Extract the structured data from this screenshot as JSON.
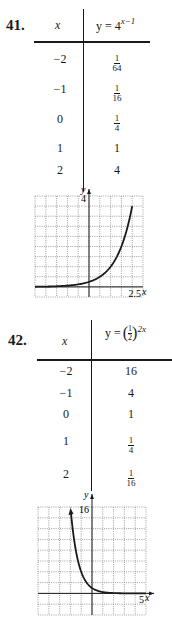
{
  "problems": [
    {
      "number": "41.",
      "x_header": "x",
      "y_header": {
        "lhs": "y = 4",
        "exponent": "x−1"
      },
      "rows": [
        {
          "x": "−2",
          "y_num": "1",
          "y_den": "64",
          "y_text": ""
        },
        {
          "x": "−1",
          "y_num": "1",
          "y_den": "16",
          "y_text": ""
        },
        {
          "x": "0",
          "y_num": "1",
          "y_den": "4",
          "y_text": ""
        },
        {
          "x": "1",
          "y_num": "",
          "y_den": "",
          "y_text": "1"
        },
        {
          "x": "2",
          "y_num": "",
          "y_den": "",
          "y_text": "4"
        }
      ],
      "graph": {
        "y_axis_label": "y",
        "x_axis_label": "x",
        "y_tick_label": "4",
        "x_tick_label": "2.5"
      }
    },
    {
      "number": "42.",
      "x_header": "x",
      "y_header": {
        "lhs": "y =",
        "base_num": "1",
        "base_den": "2",
        "exponent": "2x"
      },
      "rows": [
        {
          "x": "−2",
          "y_num": "",
          "y_den": "",
          "y_text": "16"
        },
        {
          "x": "−1",
          "y_num": "",
          "y_den": "",
          "y_text": "4"
        },
        {
          "x": "0",
          "y_num": "",
          "y_den": "",
          "y_text": "1"
        },
        {
          "x": "1",
          "y_num": "1",
          "y_den": "4",
          "y_text": ""
        },
        {
          "x": "2",
          "y_num": "1",
          "y_den": "16",
          "y_text": ""
        }
      ],
      "graph": {
        "y_axis_label": "y",
        "x_axis_label": "x",
        "y_tick_label": "16",
        "x_tick_label": "5"
      }
    }
  ],
  "chart_data": [
    {
      "type": "line",
      "title": "y = 4^(x−1)",
      "xlabel": "x",
      "ylabel": "y",
      "xlim": [
        -2.5,
        2.5
      ],
      "ylim": [
        -0.5,
        4.5
      ],
      "x_ticks_labeled": [
        "2.5"
      ],
      "y_ticks_labeled": [
        "4"
      ],
      "grid": true,
      "x": [
        -2.5,
        -2,
        -1.5,
        -1,
        -0.5,
        0,
        0.5,
        1,
        1.5,
        2
      ],
      "series": [
        {
          "name": "y = 4^(x−1)",
          "values": [
            0.0078,
            0.0156,
            0.0313,
            0.0625,
            0.125,
            0.25,
            0.5,
            1,
            2,
            4
          ]
        }
      ]
    },
    {
      "type": "line",
      "title": "y = (1/2)^(2x)",
      "xlabel": "x",
      "ylabel": "y",
      "xlim": [
        -5,
        5
      ],
      "ylim": [
        -4,
        16
      ],
      "x_ticks_labeled": [
        "5"
      ],
      "y_ticks_labeled": [
        "16"
      ],
      "grid": true,
      "x": [
        -2,
        -1.5,
        -1,
        -0.5,
        0,
        0.5,
        1,
        2,
        3,
        4,
        5
      ],
      "series": [
        {
          "name": "y = (1/2)^(2x)",
          "values": [
            16,
            8,
            4,
            2,
            1,
            0.5,
            0.25,
            0.0625,
            0.0156,
            0.0039,
            0.001
          ]
        }
      ]
    }
  ]
}
